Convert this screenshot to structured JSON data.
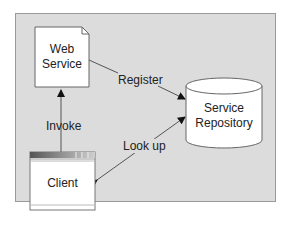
{
  "diagram": {
    "nodes": {
      "web_service": {
        "line1": "Web",
        "line2": "Service",
        "shape": "document"
      },
      "service_repository": {
        "line1": "Service",
        "line2": "Repository",
        "shape": "cylinder"
      },
      "client": {
        "label": "Client",
        "shape": "window"
      }
    },
    "edges": {
      "register": {
        "label": "Register",
        "from": "Web Service",
        "to": "Service Repository"
      },
      "invoke": {
        "label": "Invoke",
        "from": "Client",
        "to": "Web Service"
      },
      "look_up": {
        "label": "Look up",
        "from": "Client",
        "to": "Service Repository",
        "bidirectional": true
      }
    },
    "colors": {
      "background": "#dcdcdc",
      "node_fill": "#ffffff",
      "stroke": "#555555"
    }
  }
}
